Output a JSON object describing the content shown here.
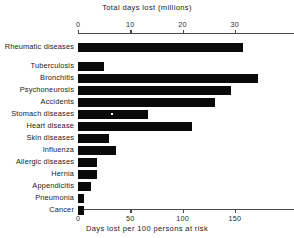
{
  "chart_data": {
    "type": "bar",
    "orientation": "horizontal",
    "title": "",
    "top_axis_label": "Total days lost (millions)",
    "bottom_axis_label": "Days lost per 100 persons at risk",
    "ylabel": "",
    "grid": false,
    "legend": null,
    "top_axis": {
      "label": "Total days lost (millions)",
      "ticks": [
        0,
        10,
        20,
        30
      ],
      "tick_labels": [
        "0",
        "10",
        "20",
        "30"
      ],
      "range": [
        0,
        37.5
      ]
    },
    "bottom_axis": {
      "label": "Days lost per 100 persons at risk",
      "ticks": [
        0,
        50,
        100,
        150
      ],
      "tick_labels": [
        "0",
        "50",
        "100",
        "150"
      ],
      "range": [
        0,
        187.5
      ]
    },
    "categories": [
      "Rheumatic diseases",
      "Tuberculosis",
      "Bronchitis",
      "Psychoneurosis",
      "Accidents",
      "Stomach diseases",
      "Heart disease",
      "Skin diseases",
      "Influenza",
      "Allergic diseases",
      "Hernia",
      "Appendicitis",
      "Pneumonia",
      "Cancer"
    ],
    "values": [
      31.5,
      5.0,
      34.5,
      29.3,
      26.2,
      13.3,
      21.9,
      6.0,
      7.2,
      3.6,
      3.6,
      2.4,
      1.2,
      1.2
    ],
    "value_unit": "millions of days lost",
    "bar_color": "#0a0a0a"
  },
  "colors": {
    "bar": "#0a0a0a",
    "axis": "#4a4a4a",
    "text": "#1a1a1a",
    "background": "#ffffff"
  }
}
